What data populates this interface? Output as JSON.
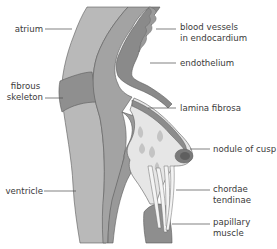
{
  "figure": {
    "colors": {
      "background": "#ffffff",
      "atrium_wall": "#b9b9b9",
      "fibrous_skeleton": "#8f8f8f",
      "ventricle_wall": "#b4b4b4",
      "endocardium": "#9a9a9a",
      "endothelium": "#7e7e7e",
      "cusp_spongiosa": "#e6e6e6",
      "cusp_inclusions": "#c4c4c4",
      "nodule": "#6e6e6e",
      "chordae": "#f4f4f4",
      "papillary_muscle": "#8e8e8e",
      "label_text": "#3a3a3a",
      "leader_line": "#4a4a4a"
    }
  },
  "labels": {
    "left": [
      {
        "id": "atrium",
        "lines": [
          "atrium"
        ]
      },
      {
        "id": "fibrous-skeleton",
        "lines": [
          "fibrous",
          "skeleton"
        ]
      },
      {
        "id": "ventricle",
        "lines": [
          "ventricle"
        ]
      }
    ],
    "right": [
      {
        "id": "blood-vessels",
        "lines": [
          "blood vessels",
          "in endocardium"
        ]
      },
      {
        "id": "endothelium",
        "lines": [
          "endothelium"
        ]
      },
      {
        "id": "lamina-fibrosa",
        "lines": [
          "lamina fibrosa"
        ]
      },
      {
        "id": "nodule-of-cusp",
        "lines": [
          "nodule of cusp"
        ]
      },
      {
        "id": "chordae-tendinae",
        "lines": [
          "chordae",
          "tendinae"
        ]
      },
      {
        "id": "papillary-muscle",
        "lines": [
          "papillary",
          "muscle"
        ]
      }
    ]
  }
}
